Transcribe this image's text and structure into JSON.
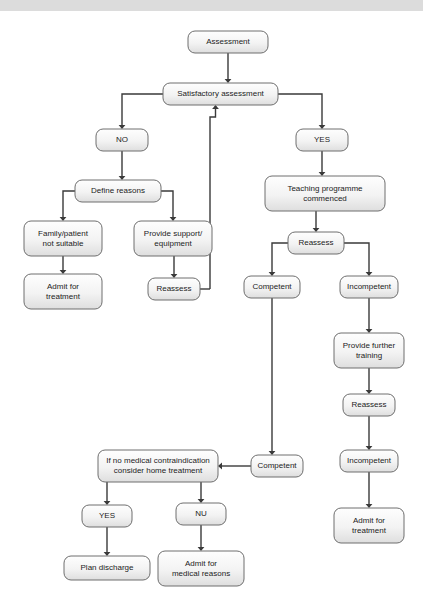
{
  "page": {
    "background_color": "#ffffff",
    "top_bar_color": "#dcdcdc"
  },
  "style": {
    "box_fill_light": "#fdfdfd",
    "box_fill_dark": "#e2e2e2",
    "box_border_color": "#6e6e6e",
    "edge_color": "#3a3a3a",
    "text_color": "#1c1c1c"
  },
  "chart_data": {
    "type": "diagram",
    "nodes": [
      {
        "id": "assessment",
        "label": "Assessment",
        "lines": [
          "Assessment"
        ],
        "x": 188,
        "y": 31,
        "w": 80,
        "h": 22
      },
      {
        "id": "satisfactory",
        "label": "Satisfactory assessment",
        "lines": [
          "Satisfactory assessment"
        ],
        "x": 163,
        "y": 83,
        "w": 115,
        "h": 22
      },
      {
        "id": "no-1",
        "label": "NO",
        "lines": [
          "NO"
        ],
        "x": 96,
        "y": 129,
        "w": 52,
        "h": 22
      },
      {
        "id": "yes-1",
        "label": "YES",
        "lines": [
          "YES"
        ],
        "x": 296,
        "y": 129,
        "w": 52,
        "h": 22
      },
      {
        "id": "define-reasons",
        "label": "Define reasons",
        "lines": [
          "Define reasons"
        ],
        "x": 75,
        "y": 180,
        "w": 86,
        "h": 22
      },
      {
        "id": "family-not-suitable",
        "label": "Family/patient not suitable",
        "lines": [
          "Family/patient",
          "not suitable"
        ],
        "x": 24,
        "y": 221,
        "w": 78,
        "h": 35
      },
      {
        "id": "provide-support",
        "label": "Provide support/ equipment",
        "lines": [
          "Provide support/",
          "equipment"
        ],
        "x": 134,
        "y": 221,
        "w": 78,
        "h": 35
      },
      {
        "id": "admit-treatment-left",
        "label": "Admit for treatment",
        "lines": [
          "Admit for",
          "treatment"
        ],
        "x": 24,
        "y": 274,
        "w": 78,
        "h": 35
      },
      {
        "id": "reassess-left",
        "label": "Reassess",
        "lines": [
          "Reassess"
        ],
        "x": 148,
        "y": 278,
        "w": 52,
        "h": 22
      },
      {
        "id": "teaching-programme",
        "label": "Teaching programme commenced",
        "lines": [
          "Teaching programme",
          "commenced"
        ],
        "x": 265,
        "y": 176,
        "w": 120,
        "h": 35
      },
      {
        "id": "reassess-right",
        "label": "Reassess",
        "lines": [
          "Reassess"
        ],
        "x": 288,
        "y": 232,
        "w": 56,
        "h": 22
      },
      {
        "id": "competent-top",
        "label": "Competent",
        "lines": [
          "Competent"
        ],
        "x": 244,
        "y": 276,
        "w": 56,
        "h": 22
      },
      {
        "id": "incompetent-1",
        "label": "Incompetent",
        "lines": [
          "Incompetent"
        ],
        "x": 340,
        "y": 276,
        "w": 58,
        "h": 22
      },
      {
        "id": "provide-training",
        "label": "Provide further training",
        "lines": [
          "Provide further",
          "training"
        ],
        "x": 334,
        "y": 333,
        "w": 70,
        "h": 35
      },
      {
        "id": "reassess-right-2",
        "label": "Reassess",
        "lines": [
          "Reassess"
        ],
        "x": 343,
        "y": 394,
        "w": 52,
        "h": 22
      },
      {
        "id": "incompetent-2",
        "label": "Incompetent",
        "lines": [
          "Incompetent"
        ],
        "x": 340,
        "y": 450,
        "w": 58,
        "h": 22
      },
      {
        "id": "admit-treatment-right",
        "label": "Admit for treatment",
        "lines": [
          "Admit for",
          "treatment"
        ],
        "x": 334,
        "y": 508,
        "w": 70,
        "h": 35
      },
      {
        "id": "competent-bottom",
        "label": "Competent",
        "lines": [
          "Competent"
        ],
        "x": 251,
        "y": 455,
        "w": 52,
        "h": 22
      },
      {
        "id": "home-treatment",
        "label": "If no medical contraindication consider home treatment",
        "lines": [
          "If no medical contraindication",
          "consider home treatment"
        ],
        "x": 98,
        "y": 450,
        "w": 120,
        "h": 32
      },
      {
        "id": "yes-2",
        "label": "YES",
        "lines": [
          "YES"
        ],
        "x": 82,
        "y": 505,
        "w": 50,
        "h": 22
      },
      {
        "id": "no-2",
        "label": "NU",
        "lines": [
          "NU"
        ],
        "x": 176,
        "y": 503,
        "w": 50,
        "h": 22
      },
      {
        "id": "plan-discharge",
        "label": "Plan discharge",
        "lines": [
          "Plan discharge"
        ],
        "x": 64,
        "y": 556,
        "w": 86,
        "h": 24
      },
      {
        "id": "admit-medical-reasons",
        "label": "Admit for medical reasons",
        "lines": [
          "Admit for",
          "medical reasons"
        ],
        "x": 158,
        "y": 551,
        "w": 86,
        "h": 35
      }
    ],
    "edges": [
      {
        "from": "assessment",
        "to": "satisfactory",
        "label": ""
      },
      {
        "from": "satisfactory",
        "to": "no-1",
        "label": ""
      },
      {
        "from": "satisfactory",
        "to": "yes-1",
        "label": ""
      },
      {
        "from": "no-1",
        "to": "define-reasons",
        "label": ""
      },
      {
        "from": "define-reasons",
        "to": "family-not-suitable",
        "label": ""
      },
      {
        "from": "define-reasons",
        "to": "provide-support",
        "label": ""
      },
      {
        "from": "family-not-suitable",
        "to": "admit-treatment-left",
        "label": ""
      },
      {
        "from": "provide-support",
        "to": "reassess-left",
        "label": ""
      },
      {
        "from": "reassess-left",
        "to": "satisfactory",
        "label": ""
      },
      {
        "from": "yes-1",
        "to": "teaching-programme",
        "label": ""
      },
      {
        "from": "teaching-programme",
        "to": "reassess-right",
        "label": ""
      },
      {
        "from": "reassess-right",
        "to": "competent-top",
        "label": ""
      },
      {
        "from": "reassess-right",
        "to": "incompetent-1",
        "label": ""
      },
      {
        "from": "competent-top",
        "to": "competent-bottom",
        "label": ""
      },
      {
        "from": "incompetent-1",
        "to": "provide-training",
        "label": ""
      },
      {
        "from": "provide-training",
        "to": "reassess-right-2",
        "label": ""
      },
      {
        "from": "reassess-right-2",
        "to": "incompetent-2",
        "label": ""
      },
      {
        "from": "incompetent-2",
        "to": "admit-treatment-right",
        "label": ""
      },
      {
        "from": "competent-bottom",
        "to": "home-treatment",
        "label": ""
      },
      {
        "from": "home-treatment",
        "to": "yes-2",
        "label": ""
      },
      {
        "from": "home-treatment",
        "to": "no-2",
        "label": ""
      },
      {
        "from": "yes-2",
        "to": "plan-discharge",
        "label": ""
      },
      {
        "from": "no-2",
        "to": "admit-medical-reasons",
        "label": ""
      }
    ]
  }
}
